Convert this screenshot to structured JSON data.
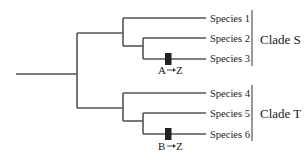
{
  "diagram": {
    "type": "phylogenetic-tree",
    "clades": [
      {
        "id": "S",
        "label": "Clade S",
        "species": [
          "Species 1",
          "Species 2",
          "Species 3"
        ],
        "mutation": {
          "from": "A",
          "to": "Z",
          "on_branch": "Species 3"
        }
      },
      {
        "id": "T",
        "label": "Clade T",
        "species": [
          "Species 4",
          "Species 5",
          "Species 6"
        ],
        "mutation": {
          "from": "B",
          "to": "Z",
          "on_branch": "Species 6"
        }
      }
    ],
    "topology": "((Species 1,(Species 2,Species 3)),(Species 4,(Species 5,Species 6)))",
    "colors": {
      "branch": "#555555",
      "mutation_marker": "#222222",
      "text": "#1a1a1a"
    }
  }
}
